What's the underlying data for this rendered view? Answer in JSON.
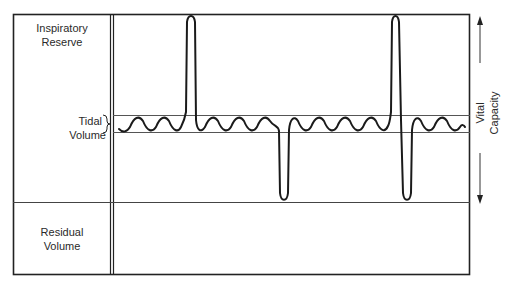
{
  "diagram": {
    "labels": {
      "inspiratory_reserve": [
        "Inspiratory",
        "Reserve"
      ],
      "tidal_volume": [
        "Tidal",
        "Volume"
      ],
      "residual_volume": [
        "Residual",
        "Volume"
      ],
      "vital_capacity": [
        "Vital",
        "Capacity"
      ]
    },
    "colors": {
      "line": "#222222",
      "gridline": "#555555",
      "background": "#ffffff"
    },
    "regions": [
      {
        "name": "Inspiratory Reserve",
        "position": "top"
      },
      {
        "name": "Tidal Volume",
        "position": "middle band"
      },
      {
        "name": "Residual Volume",
        "position": "bottom"
      }
    ],
    "trace": {
      "description": "Tidal breathing oscillations with two maximal inspirations reaching top of frame and two maximal expirations reaching residual volume line",
      "events": [
        "tidal",
        "max-inspiration",
        "tidal",
        "max-expiration",
        "tidal",
        "max-inspiration",
        "max-expiration",
        "tidal"
      ]
    }
  }
}
